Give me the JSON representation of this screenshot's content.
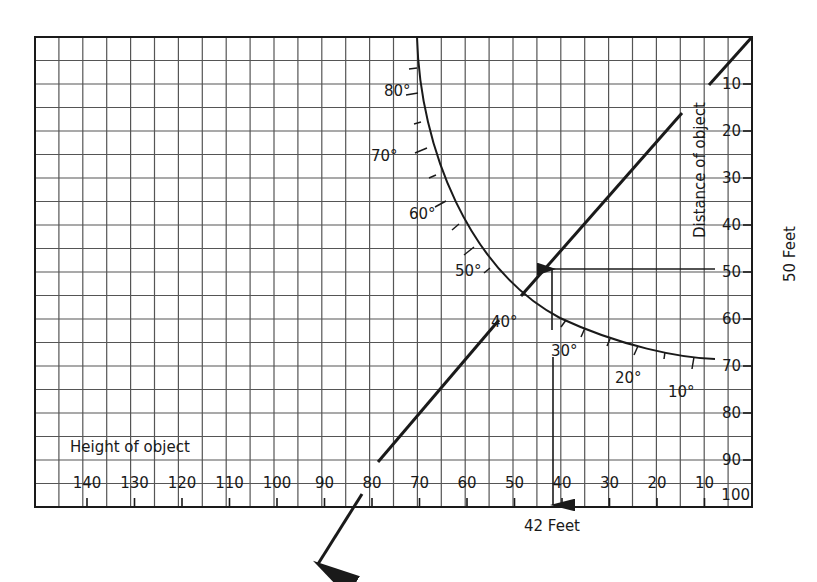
{
  "diagram": {
    "type": "nomogram",
    "height_axis": {
      "label": "Height of object",
      "ticks": [
        "140",
        "130",
        "120",
        "110",
        "100",
        "90",
        "80",
        "70",
        "60",
        "50",
        "40",
        "30",
        "20",
        "10"
      ]
    },
    "distance_axis": {
      "label": "Distance of object",
      "ticks": [
        "10",
        "20",
        "30",
        "40",
        "50",
        "60",
        "70",
        "80",
        "90",
        "100"
      ]
    },
    "angle_scale": {
      "labels": [
        "80°",
        "70°",
        "60°",
        "50°",
        "40°",
        "30°",
        "20°",
        "10°"
      ]
    },
    "annotations": {
      "distance_result": "50 Feet",
      "height_result": "42 Feet"
    },
    "example": {
      "distance_ft": 50,
      "angle_deg": 40,
      "height_ft": 42
    },
    "colors": {
      "ink": "#1a1a1a",
      "grid": "#555555",
      "paper": "#ffffff"
    }
  }
}
